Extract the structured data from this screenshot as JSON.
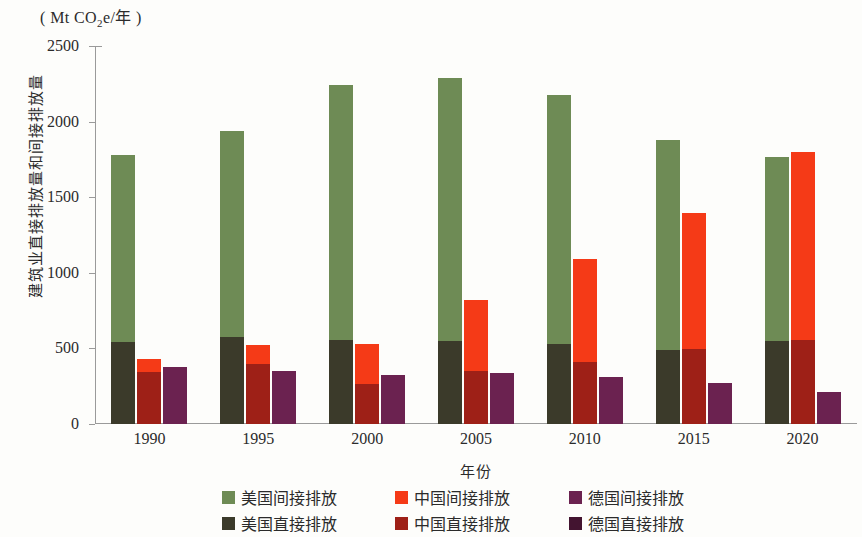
{
  "chart_data": {
    "type": "bar",
    "title": "",
    "unit_label": "( Mt CO2e/年 )",
    "ylabel": "建筑业直接排放量和间接排放量",
    "xlabel": "年份",
    "categories": [
      "1990",
      "1995",
      "2000",
      "2005",
      "2010",
      "2015",
      "2020"
    ],
    "ylim": [
      0,
      2500
    ],
    "yticks": [
      0,
      500,
      1000,
      1500,
      2000,
      2500
    ],
    "ytick_labels": [
      "0",
      "500",
      "1000",
      "1500",
      "2000",
      "2500"
    ],
    "grid": false,
    "stacked": true,
    "legend_position": "bottom",
    "colors": {
      "us_indirect": "#6e8b55",
      "us_direct": "#3b3a2a",
      "cn_indirect": "#f53a17",
      "cn_direct": "#9e2017",
      "de_indirect": "#6b2250",
      "de_direct": "#431430"
    },
    "series": [
      {
        "name": "美国间接排放",
        "key": "us_indirect",
        "values": [
          1235,
          1365,
          1685,
          1740,
          1645,
          1390,
          1215
        ]
      },
      {
        "name": "美国直接排放",
        "key": "us_direct",
        "values": [
          545,
          575,
          555,
          550,
          530,
          490,
          550
        ]
      },
      {
        "name": "中国间接排放",
        "key": "cn_indirect",
        "values": [
          85,
          120,
          265,
          470,
          680,
          900,
          1245
        ]
      },
      {
        "name": "中国直接排放",
        "key": "cn_direct",
        "values": [
          345,
          400,
          265,
          350,
          410,
          495,
          555
        ]
      },
      {
        "name": "德国间接排放",
        "key": "de_indirect",
        "values": [
          380,
          350,
          325,
          335,
          310,
          270,
          215
        ]
      },
      {
        "name": "德国直接排放",
        "key": "de_direct",
        "values": [
          0,
          0,
          0,
          0,
          0,
          0,
          0
        ]
      }
    ],
    "totals": {
      "us": [
        1780,
        1940,
        2240,
        2290,
        2175,
        1880,
        1765
      ],
      "cn": [
        430,
        520,
        530,
        820,
        1090,
        1395,
        1800
      ],
      "de": [
        380,
        350,
        325,
        335,
        310,
        270,
        215
      ]
    },
    "annotations": []
  },
  "legend": {
    "items": [
      {
        "label": "美国间接排放",
        "swatch": "sw-us-ind"
      },
      {
        "label": "中国间接排放",
        "swatch": "sw-cn-ind"
      },
      {
        "label": "德国间接排放",
        "swatch": "sw-de-ind"
      },
      {
        "label": "美国直接排放",
        "swatch": "sw-us-dir"
      },
      {
        "label": "中国直接排放",
        "swatch": "sw-cn-dir"
      },
      {
        "label": "德国直接排放",
        "swatch": "sw-de-dir"
      }
    ]
  }
}
